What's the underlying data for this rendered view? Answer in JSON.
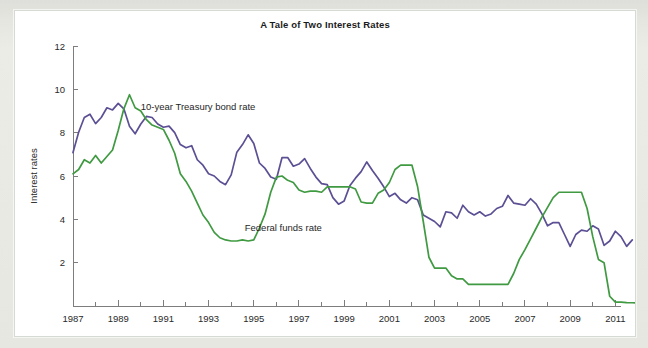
{
  "card": {
    "background_color": "#ffffff",
    "border_color": "#d5dbd2"
  },
  "chart_data": {
    "type": "line",
    "title": "A Tale of Two Interest Rates",
    "xlabel": "",
    "ylabel": "Interest rates",
    "xlim": [
      1987,
      2011.25
    ],
    "ylim": [
      0,
      12
    ],
    "grid": false,
    "legend_position": "inline-annotation",
    "x_ticks": [
      "1987",
      "1989",
      "1991",
      "1993",
      "1995",
      "1997",
      "1999",
      "2001",
      "2003",
      "2005",
      "2007",
      "2009",
      "2011"
    ],
    "x_tick_values": [
      1987,
      1989,
      1991,
      1993,
      1995,
      1997,
      1999,
      2001,
      2003,
      2005,
      2007,
      2009,
      2011
    ],
    "x_minor_tick_values": [
      1988,
      1990,
      1992,
      1994,
      1996,
      1998,
      2000,
      2002,
      2004,
      2006,
      2008,
      2010
    ],
    "y_ticks": [
      "2",
      "4",
      "6",
      "8",
      "10",
      "12"
    ],
    "y_tick_values": [
      2,
      4,
      6,
      8,
      10,
      12
    ],
    "annotations": [
      {
        "text": "10-year Treasury bond rate",
        "x": 1990.0,
        "y": 9.05
      },
      {
        "text": "Federal funds rate",
        "x": 1994.6,
        "y": 3.45
      }
    ],
    "series": [
      {
        "name": "10-year Treasury bond rate",
        "color": "#5c4f94",
        "x_start": 1987.0,
        "x_step": 0.25,
        "values": [
          7.08,
          8.02,
          8.7,
          8.85,
          8.42,
          8.7,
          9.15,
          9.05,
          9.35,
          9.1,
          8.3,
          7.95,
          8.4,
          8.75,
          8.7,
          8.4,
          8.25,
          8.3,
          8.0,
          7.45,
          7.3,
          7.4,
          6.75,
          6.5,
          6.1,
          6.0,
          5.75,
          5.6,
          6.05,
          7.1,
          7.45,
          7.9,
          7.5,
          6.6,
          6.35,
          5.95,
          5.85,
          6.85,
          6.85,
          6.45,
          6.55,
          6.8,
          6.35,
          5.95,
          5.65,
          5.6,
          5.0,
          4.7,
          4.85,
          5.55,
          5.9,
          6.2,
          6.65,
          6.25,
          5.9,
          5.5,
          5.05,
          5.2,
          4.9,
          4.75,
          5.0,
          4.9,
          4.2,
          4.05,
          3.9,
          3.65,
          4.35,
          4.3,
          4.05,
          4.65,
          4.35,
          4.2,
          4.35,
          4.15,
          4.25,
          4.5,
          4.6,
          5.1,
          4.75,
          4.7,
          4.65,
          4.95,
          4.7,
          4.25,
          3.7,
          3.85,
          3.85,
          3.3,
          2.75,
          3.3,
          3.5,
          3.45,
          3.7,
          3.55,
          2.8,
          3.0,
          3.45,
          3.2,
          2.75,
          3.05
        ]
      },
      {
        "name": "Federal funds rate",
        "color": "#3f9a41",
        "x_start": 1987.0,
        "x_step": 0.25,
        "values": [
          6.1,
          6.3,
          6.75,
          6.6,
          6.95,
          6.6,
          6.9,
          7.2,
          8.1,
          9.1,
          9.75,
          9.15,
          9.0,
          8.6,
          8.35,
          8.25,
          8.15,
          7.65,
          7.05,
          6.1,
          5.75,
          5.3,
          4.75,
          4.2,
          3.85,
          3.4,
          3.15,
          3.05,
          3.0,
          3.0,
          3.05,
          3.0,
          3.05,
          3.6,
          4.25,
          5.25,
          5.95,
          6.0,
          5.8,
          5.7,
          5.35,
          5.25,
          5.3,
          5.3,
          5.25,
          5.5,
          5.5,
          5.5,
          5.5,
          5.5,
          5.4,
          4.8,
          4.75,
          4.75,
          5.2,
          5.35,
          5.7,
          6.3,
          6.5,
          6.5,
          6.5,
          5.5,
          3.9,
          2.25,
          1.75,
          1.75,
          1.75,
          1.4,
          1.25,
          1.25,
          1.0,
          1.0,
          1.0,
          1.0,
          1.0,
          1.0,
          1.0,
          1.0,
          1.5,
          2.15,
          2.6,
          3.1,
          3.6,
          4.1,
          4.55,
          5.0,
          5.25,
          5.25,
          5.25,
          5.25,
          5.25,
          4.5,
          3.2,
          2.15,
          2.0,
          0.45,
          0.18,
          0.18,
          0.16,
          0.15,
          0.13,
          0.18,
          0.18,
          0.17,
          0.15,
          0.16,
          0.17,
          0.16
        ]
      }
    ]
  }
}
